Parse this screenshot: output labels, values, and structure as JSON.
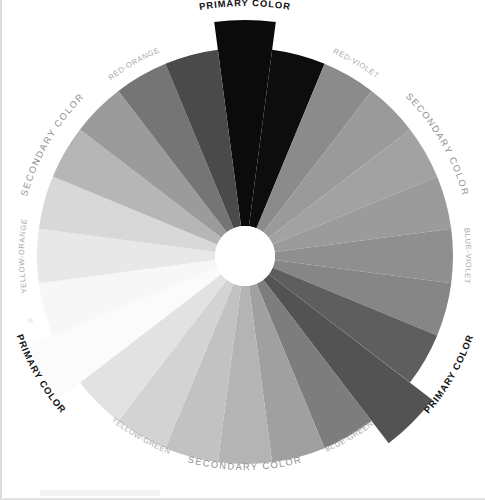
{
  "figure": {
    "background_color": "#ffffff",
    "center_x": 245,
    "center_y": 256,
    "outer_radius": 208,
    "inner_radius": 30,
    "extended_radius": 236,
    "segment_count": 24
  },
  "chart_data": {
    "type": "pie",
    "xlabel": "",
    "ylabel": "",
    "legend_position": "around-perimeter",
    "grid": false,
    "categories": [
      "Red",
      "Red",
      "Red-Violet",
      "Red-Violet",
      "Violet",
      "Violet",
      "Blue-Violet",
      "Blue-Violet",
      "Blue",
      "Blue",
      "Blue-Green",
      "Blue-Green",
      "Green",
      "Green",
      "Yellow-Green",
      "Yellow-Green",
      "Yellow",
      "Yellow",
      "Yellow-Orange",
      "Yellow-Orange",
      "Orange",
      "Orange",
      "Red-Orange",
      "Red-Orange"
    ],
    "values": [
      15,
      15,
      15,
      15,
      15,
      15,
      15,
      15,
      15,
      15,
      15,
      15,
      15,
      15,
      15,
      15,
      15,
      15,
      15,
      15,
      15,
      15,
      15,
      15
    ],
    "series": [
      {
        "name": "Grayscale value",
        "values": [
          8,
          10,
          96,
          108,
          118,
          112,
          104,
          96,
          72,
          66,
          92,
          118,
          140,
          156,
          176,
          196,
          246,
          243,
          226,
          206,
          178,
          150,
          116,
          70
        ]
      }
    ],
    "segment_fills": [
      "#0b0b0b",
      "#0d0d0d",
      "#8b8b8b",
      "#9a9a9a",
      "#a2a2a2",
      "#9b9b9b",
      "#8f8f8f",
      "#868686",
      "#5e5e5e",
      "#535353",
      "#7d7d7d",
      "#a0a0a0",
      "#b4b4b4",
      "#c2c2c2",
      "#d3d3d3",
      "#e2e2e2",
      "#fbfbfb",
      "#f7f7f7",
      "#e8e8e8",
      "#d8d8d8",
      "#b6b6b6",
      "#9b9b9b",
      "#757575",
      "#4a4a4a"
    ],
    "segment_start_angles_deg": [
      -7.5,
      7.5,
      22.5,
      37.5,
      52.5,
      67.5,
      82.5,
      97.5,
      112.5,
      127.5,
      142.5,
      157.5,
      172.5,
      187.5,
      202.5,
      217.5,
      232.5,
      247.5,
      262.5,
      277.5,
      292.5,
      307.5,
      322.5,
      337.5
    ],
    "extended_segment_indices": [
      0,
      9,
      16
    ]
  },
  "labels": {
    "primary": [
      {
        "id": "primary-top",
        "text": "PRIMARY COLOR",
        "hue": "Red",
        "position": "top",
        "angle_deg": 0,
        "weight": "bold",
        "color": "#121212"
      },
      {
        "id": "primary-right",
        "text": "PRIMARY COLOR",
        "hue": "Blue",
        "position": "lower-right",
        "angle_deg": 120,
        "weight": "bold",
        "color": "#121212"
      },
      {
        "id": "primary-left",
        "text": "PRIMARY COLOR",
        "hue": "Yellow",
        "position": "left",
        "angle_deg": 240,
        "weight": "bold",
        "color": "#121212"
      }
    ],
    "secondary": [
      {
        "id": "secondary-upper-right",
        "text": "SECONDARY COLOR",
        "hue": "Violet",
        "position": "upper-right",
        "angle_deg": 60,
        "color": "#8f8f8f"
      },
      {
        "id": "secondary-bottom",
        "text": "SECONDARY COLOR",
        "hue": "Green",
        "position": "bottom",
        "angle_deg": 180,
        "color": "#8f8f8f"
      },
      {
        "id": "secondary-upper-left",
        "text": "SECONDARY COLOR",
        "hue": "Orange",
        "position": "upper-left",
        "angle_deg": 300,
        "color": "#8f8f8f"
      }
    ],
    "tertiary": [
      {
        "id": "red-violet",
        "text": "RED-VIOLET",
        "position": "upper-right",
        "angle_deg": 30,
        "color": "#a9a9a9"
      },
      {
        "id": "blue-violet",
        "text": "BLUE-VIOLET",
        "position": "right",
        "angle_deg": 90,
        "color": "#a9a9a9"
      },
      {
        "id": "blue-green",
        "text": "BLUE-GREEN",
        "position": "lower-right",
        "angle_deg": 150,
        "color": "#a9a9a9"
      },
      {
        "id": "yellow-green",
        "text": "YELLOW-GREEN",
        "position": "lower-left",
        "angle_deg": 210,
        "color": "#a9a9a9"
      },
      {
        "id": "yellow-orange",
        "text": "YELLOW-ORANGE",
        "position": "left",
        "angle_deg": 270,
        "color": "#a9a9a9"
      },
      {
        "id": "red-orange",
        "text": "RED-ORANGE",
        "position": "upper-left",
        "angle_deg": 330,
        "color": "#a9a9a9"
      }
    ]
  }
}
